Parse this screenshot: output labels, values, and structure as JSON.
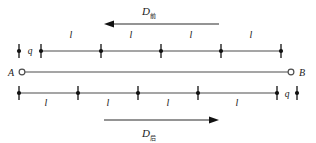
{
  "figure": {
    "title": "",
    "background_color": "#ffffff",
    "line_color": "#4d4d4d",
    "mark_color": "#111111",
    "width": 316,
    "height": 143
  },
  "arrows": {
    "top": {
      "symbol": "D",
      "subscript": "前",
      "direction": "left",
      "x_start": 219,
      "x_end": 104,
      "y": 24
    },
    "bottom": {
      "symbol": "D",
      "subscript": "后",
      "direction": "right",
      "x_start": 104,
      "x_end": 219,
      "y": 120
    }
  },
  "top_row": {
    "charge_label": "q",
    "charge_label_x": 30,
    "lone_tick_x": 19,
    "tick_xs": [
      41,
      101,
      161,
      221,
      281
    ],
    "rail_y": 51,
    "segment_label": "l",
    "segment_label_y": 38,
    "segment_labels": [
      "l",
      "l",
      "l",
      "l"
    ],
    "segment_label_xs": [
      71,
      131,
      191,
      251
    ]
  },
  "middle_row": {
    "left_node": "A",
    "right_node": "B",
    "left_node_x": 11,
    "right_node_x": 302,
    "circle_left_x": 22,
    "circle_right_x": 291,
    "rail_y": 72
  },
  "bottom_row": {
    "charge_label": "q",
    "charge_label_x": 287,
    "lone_tick_x": 297,
    "tick_xs": [
      19,
      78,
      138,
      198,
      277
    ],
    "rail_y": 93,
    "segment_label": "l",
    "segment_label_y": 106,
    "segment_labels": [
      "l",
      "l",
      "l",
      "l"
    ],
    "segment_label_xs": [
      46,
      108,
      168,
      237
    ]
  }
}
